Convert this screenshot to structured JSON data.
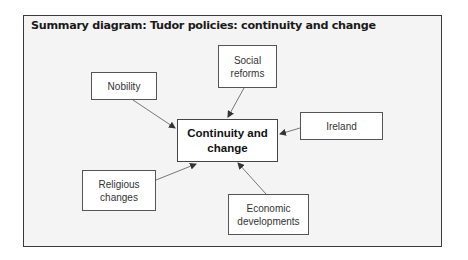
{
  "title": "Summary diagram: Tudor policies: continuity and change",
  "center": {
    "line1": "Continuity and",
    "line2": "change"
  },
  "nodes": [
    {
      "id": "nobility",
      "line1": "Nobility",
      "line2": ""
    },
    {
      "id": "social-reforms",
      "line1": "Social",
      "line2": "reforms"
    },
    {
      "id": "ireland",
      "line1": "Ireland",
      "line2": ""
    },
    {
      "id": "religious-changes",
      "line1": "Religious",
      "line2": "changes"
    },
    {
      "id": "economic-developments",
      "line1": "Economic",
      "line2": "developments"
    }
  ],
  "colors": {
    "frame_bg": "#f4f4f4",
    "border": "#3a3a3a",
    "arrow": "#333333"
  }
}
